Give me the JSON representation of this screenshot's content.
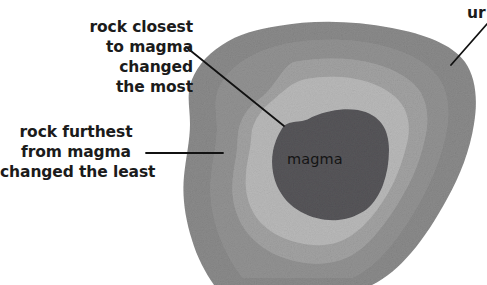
{
  "figure": {
    "kind": "geology-diagram",
    "background_color": "#ffffff",
    "width": 487,
    "height": 285
  },
  "core": {
    "label": "magma",
    "fill": "#57565a"
  },
  "zones": [
    {
      "name": "aureole-zone-inner",
      "fill": "#b9b9b9"
    },
    {
      "name": "aureole-zone-middle",
      "fill": "#a3a3a3"
    },
    {
      "name": "aureole-zone-outer",
      "fill": "#929292"
    },
    {
      "name": "unchanged-rock",
      "fill": "#8b8b8b"
    }
  ],
  "annotations": [
    {
      "name": "rock-closest-to-magma",
      "lines": [
        "rock closest",
        "to magma",
        "changed",
        "the most"
      ],
      "align": "right",
      "leader": {
        "x1": 186,
        "y1": 47,
        "x2": 284,
        "y2": 126
      }
    },
    {
      "name": "rock-furthest-from-magma",
      "lines": [
        "rock furthest",
        "from magma",
        "changed the least"
      ],
      "align": "center",
      "leader": {
        "x1": 146,
        "y1": 153,
        "x2": 223,
        "y2": 153
      }
    },
    {
      "name": "unchanged-rock",
      "lines": [
        "ur"
      ],
      "align": "left",
      "clipped_at_right_edge": true,
      "leader": {
        "x1": 487,
        "y1": 24,
        "x2": 451,
        "y2": 65
      }
    }
  ],
  "leader_line_color": "#111111"
}
